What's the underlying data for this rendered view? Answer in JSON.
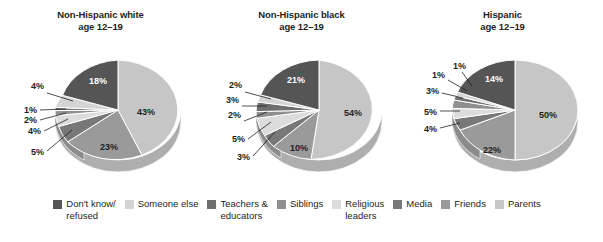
{
  "legend": {
    "position": "bottom",
    "items": [
      {
        "label": "Don't know/\nrefused",
        "color": "#555555"
      },
      {
        "label": "Someone else",
        "color": "#d4d4d4"
      },
      {
        "label": "Teachers &\neducators",
        "color": "#6e6e6e"
      },
      {
        "label": "Siblings",
        "color": "#8f8f8f"
      },
      {
        "label": "Religious\nleaders",
        "color": "#dcdcdc"
      },
      {
        "label": "Media",
        "color": "#787878"
      },
      {
        "label": "Friends",
        "color": "#9a9a9a"
      },
      {
        "label": "Parents",
        "color": "#c6c6c6"
      }
    ]
  },
  "panels": [
    {
      "title_line1": "Non-Hispanic white",
      "title_line2": "age 12–19",
      "labels": {
        "parents": "43%",
        "friends": "23%",
        "media": "5%",
        "religious_leaders": "4%",
        "siblings": "2%",
        "teachers": "1%",
        "someone_else": "4%",
        "dont_know": "18%"
      }
    },
    {
      "title_line1": "Non-Hispanic black",
      "title_line2": "age 12–19",
      "labels": {
        "parents": "54%",
        "friends": "10%",
        "media": "3%",
        "religious_leaders": "5%",
        "siblings": "2%",
        "teachers": "3%",
        "someone_else": "2%",
        "dont_know": "21%"
      }
    },
    {
      "title_line1": "Hispanic",
      "title_line2": "age 12–19",
      "labels": {
        "parents": "50%",
        "friends": "22%",
        "media": "4%",
        "religious_leaders": "5%",
        "siblings": "3%",
        "teachers": "1%",
        "someone_else": "1%",
        "dont_know": "14%"
      }
    }
  ],
  "chart_data": {
    "type": "pie",
    "title": "",
    "subtitle": "",
    "legend_position": "bottom",
    "value_unit": "percent",
    "categories": [
      "Parents",
      "Friends",
      "Media",
      "Religious leaders",
      "Siblings",
      "Teachers & educators",
      "Someone else",
      "Don't know/refused"
    ],
    "category_colors": [
      "#c6c6c6",
      "#9a9a9a",
      "#787878",
      "#dcdcdc",
      "#8f8f8f",
      "#6e6e6e",
      "#d4d4d4",
      "#555555"
    ],
    "charts": [
      {
        "title": "Non-Hispanic white age 12–19",
        "values": [
          43,
          23,
          5,
          4,
          2,
          1,
          4,
          18
        ]
      },
      {
        "title": "Non-Hispanic black age 12–19",
        "values": [
          54,
          10,
          3,
          5,
          2,
          3,
          2,
          21
        ]
      },
      {
        "title": "Hispanic age 12–19",
        "values": [
          50,
          22,
          4,
          5,
          3,
          1,
          1,
          14
        ]
      }
    ]
  }
}
